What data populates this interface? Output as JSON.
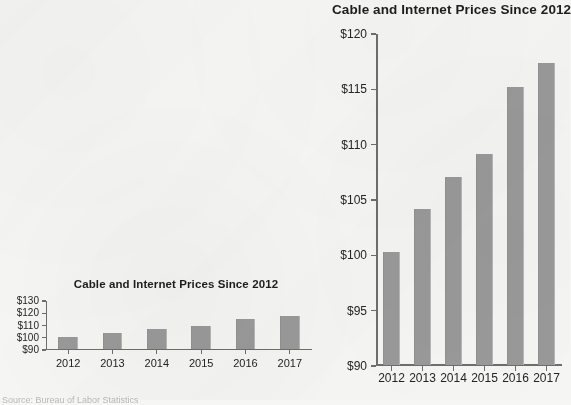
{
  "page": {
    "background_color": "#f6f6f4",
    "bar_color": "#9a9a9a",
    "axis_color": "#6e6e6e",
    "text_color": "#242424"
  },
  "source_caption": "Source: Bureau of Labor Statistics",
  "chart_data": [
    {
      "id": "large",
      "type": "bar",
      "title": "Cable and Internet Prices Since 2012",
      "xlabel": "",
      "ylabel": "",
      "categories": [
        "2012",
        "2013",
        "2014",
        "2015",
        "2016",
        "2017"
      ],
      "values": [
        100.3,
        104.2,
        107.1,
        109.2,
        115.2,
        117.4
      ],
      "ylim": [
        90,
        120
      ],
      "ytick_values": [
        90,
        95,
        100,
        105,
        110,
        115,
        120
      ],
      "ytick_labels": [
        "$90",
        "$95",
        "$100",
        "$105",
        "$110",
        "$115",
        "$120"
      ],
      "grid": false,
      "legend": false
    },
    {
      "id": "small",
      "type": "bar",
      "title": "Cable and Internet Prices Since 2012",
      "xlabel": "",
      "ylabel": "",
      "categories": [
        "2012",
        "2013",
        "2014",
        "2015",
        "2016",
        "2017"
      ],
      "values": [
        100.3,
        104.2,
        107.1,
        109.2,
        115.2,
        117.4
      ],
      "ylim": [
        90,
        130
      ],
      "ytick_values": [
        90,
        100,
        110,
        120,
        130
      ],
      "ytick_labels": [
        "$90",
        "$100",
        "$110",
        "$120",
        "$130"
      ],
      "grid": false,
      "legend": false
    }
  ]
}
